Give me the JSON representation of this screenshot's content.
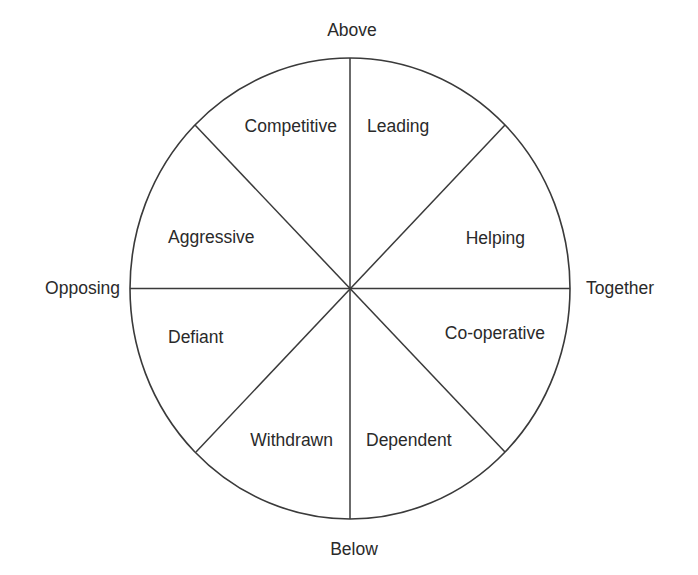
{
  "diagram": {
    "type": "circumplex-wheel",
    "axes": {
      "top": "Above",
      "bottom": "Below",
      "left": "Opposing",
      "right": "Together"
    },
    "segments": [
      {
        "id": "competitive",
        "label": "Competitive"
      },
      {
        "id": "leading",
        "label": "Leading"
      },
      {
        "id": "helping",
        "label": "Helping"
      },
      {
        "id": "co-operative",
        "label": "Co-operative"
      },
      {
        "id": "dependent",
        "label": "Dependent"
      },
      {
        "id": "withdrawn",
        "label": "Withdrawn"
      },
      {
        "id": "defiant",
        "label": "Defiant"
      },
      {
        "id": "aggressive",
        "label": "Aggressive"
      }
    ],
    "colors": {
      "line": "#3a3a3a",
      "text": "#2a2a2a",
      "background": "#ffffff"
    }
  }
}
